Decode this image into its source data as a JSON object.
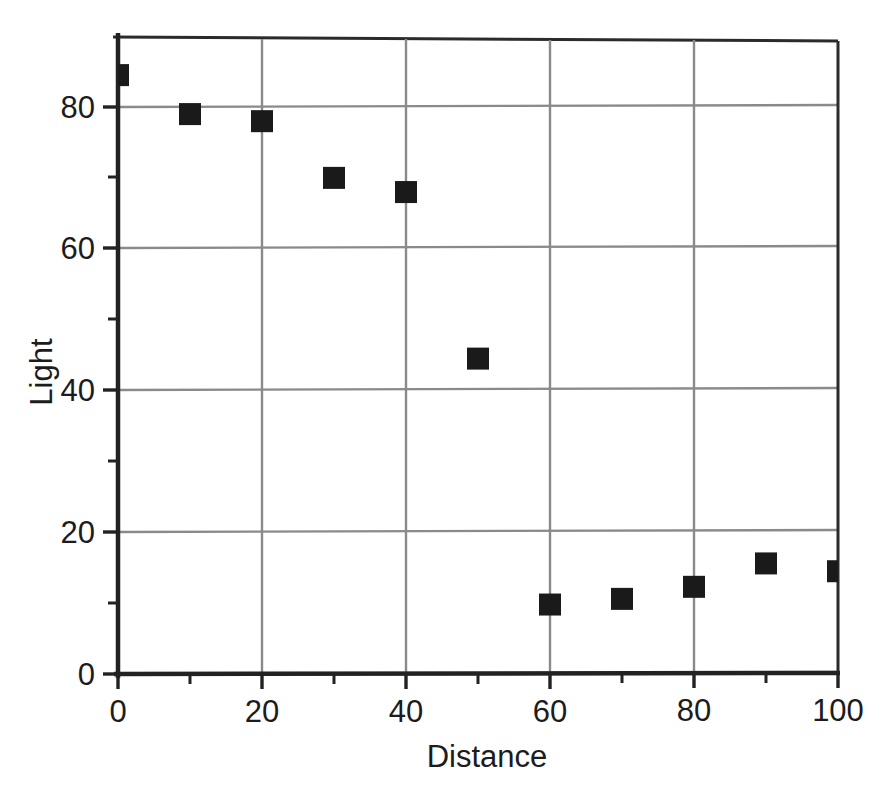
{
  "chart_data": {
    "type": "scatter",
    "title": "",
    "xlabel": "Distance",
    "ylabel": "Light",
    "xlim": [
      0,
      100
    ],
    "ylim": [
      0,
      82.5
    ],
    "grid": true,
    "legend": null,
    "marker": {
      "shape": "square",
      "color": "#1a1a1a",
      "size_px": 22
    },
    "x_ticks_major": [
      0,
      20,
      40,
      60,
      80,
      100
    ],
    "x_tick_labels": [
      "0",
      "20",
      "40",
      "60",
      "80",
      "100"
    ],
    "x_ticks_minor": [
      10,
      30,
      50,
      70,
      90
    ],
    "y_ticks_major": [
      0,
      20,
      40,
      60,
      80
    ],
    "y_tick_labels": [
      "0",
      "20",
      "40",
      "60",
      "80"
    ],
    "y_ticks_minor": [
      10,
      30,
      50,
      70
    ],
    "x": [
      0,
      10,
      20,
      30,
      40,
      50,
      60,
      70,
      80,
      90,
      100
    ],
    "values": [
      84.5,
      79.0,
      78.0,
      70.0,
      68.0,
      44.5,
      9.8,
      10.6,
      12.3,
      15.6,
      14.5
    ],
    "points": [
      {
        "x": 0,
        "y": 84.5
      },
      {
        "x": 10,
        "y": 79.0
      },
      {
        "x": 20,
        "y": 78.0
      },
      {
        "x": 30,
        "y": 70.0
      },
      {
        "x": 40,
        "y": 68.0
      },
      {
        "x": 50,
        "y": 44.5
      },
      {
        "x": 60,
        "y": 9.8
      },
      {
        "x": 70,
        "y": 10.6
      },
      {
        "x": 80,
        "y": 12.3
      },
      {
        "x": 90,
        "y": 15.6
      },
      {
        "x": 100,
        "y": 14.5
      }
    ],
    "colors": {
      "marker": "#1a1a1a",
      "grid": "#8a8a8a",
      "axis": "#262626",
      "text": "#1c1c1c",
      "background": "#ffffff"
    }
  },
  "axis": {
    "x_title": "Distance",
    "y_title": "Light",
    "x_labels": {
      "t0": "0",
      "t20": "20",
      "t40": "40",
      "t60": "60",
      "t80": "80",
      "t100": "100"
    },
    "y_labels": {
      "t0": "0",
      "t20": "20",
      "t40": "40",
      "t60": "60",
      "t80": "80"
    }
  }
}
